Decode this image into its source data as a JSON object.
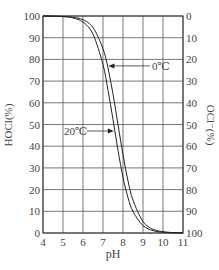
{
  "chart_data": {
    "type": "line",
    "title": "",
    "xlabel": "pH",
    "ylabel_left": "HOCl(%)",
    "ylabel_right": "OCl⁻(%)",
    "xlim": [
      4,
      11
    ],
    "ylim": [
      0,
      100
    ],
    "x_ticks": [
      4,
      5,
      6,
      7,
      8,
      9,
      10,
      11
    ],
    "y_ticks_left": [
      0,
      10,
      20,
      30,
      40,
      50,
      60,
      70,
      80,
      90,
      100
    ],
    "y_ticks_right": [
      100,
      90,
      80,
      70,
      60,
      50,
      40,
      30,
      20,
      10,
      0
    ],
    "grid": true,
    "x": [
      4,
      5,
      5.5,
      6,
      6.5,
      7,
      7.25,
      7.5,
      7.75,
      8,
      8.25,
      8.5,
      9,
      9.5,
      10,
      10.5,
      11
    ],
    "series": [
      {
        "name": "0℃",
        "values": [
          100,
          99.8,
          99.4,
          98.3,
          94.7,
          84.9,
          76.0,
          64.0,
          50.0,
          36.0,
          24.0,
          15.1,
          5.3,
          1.7,
          0.6,
          0.2,
          0.06
        ]
      },
      {
        "name": "20℃",
        "values": [
          100,
          99.7,
          99.1,
          97.2,
          91.6,
          77.6,
          65.7,
          52.3,
          38.1,
          25.7,
          16.3,
          9.9,
          3.4,
          1.1,
          0.35,
          0.1,
          0.03
        ]
      }
    ],
    "annotations": [
      {
        "text": "0℃",
        "arrow_to_series": "0℃",
        "at_y": 77
      },
      {
        "text": "20℃",
        "arrow_to_series": "20℃",
        "at_y": 47
      }
    ],
    "legend": "none (inline arrow annotations)"
  },
  "labels": {
    "xlabel": "pH",
    "ylabel_left": "HOCl(%)",
    "ylabel_right": "OCl⁻(%)",
    "annot_0c": "0℃",
    "annot_20c": "20℃"
  }
}
